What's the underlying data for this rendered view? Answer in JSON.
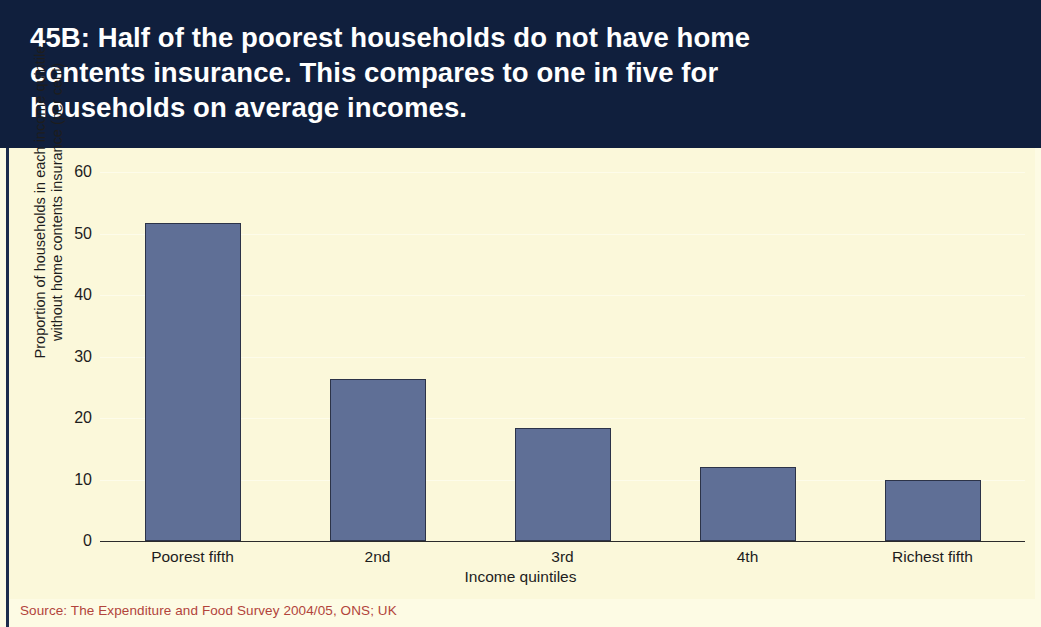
{
  "header": {
    "title": "45B: Half of the poorest households do not have home\ncontents insurance. This compares to one in five for\nhouseholds on average incomes."
  },
  "source": {
    "note": "Source: The Expenditure and Food Survey 2004/05, ONS; UK"
  },
  "colors": {
    "header_background": "#101f3d",
    "panel_background": "#fbf8da",
    "bar_fill": "#5f6f96",
    "bar_border": "#2c3348",
    "source_text": "#b2443b",
    "axis_text": "#1d1d1d"
  },
  "chart_data": {
    "type": "bar",
    "title": "45B: Half of the poorest households do not have home contents insurance. This compares to one in five for households on average incomes.",
    "xlabel": "Income quintiles",
    "ylabel": "Proportion of households in each income quintile\nwithout home contents insurance (per cent)",
    "categories": [
      "Poorest fifth",
      "2nd",
      "3rd",
      "4th",
      "Richest fifth"
    ],
    "values": [
      51.7,
      26.4,
      18.4,
      12.0,
      9.9
    ],
    "ylim": [
      0,
      60
    ],
    "yticks": [
      0,
      10,
      20,
      30,
      40,
      50,
      60
    ],
    "ytick_labels": [
      "0",
      "10",
      "20",
      "30",
      "40",
      "50",
      "60"
    ],
    "grid": true,
    "legend": false,
    "source": "Source: The Expenditure and Food Survey 2004/05, ONS; UK"
  }
}
